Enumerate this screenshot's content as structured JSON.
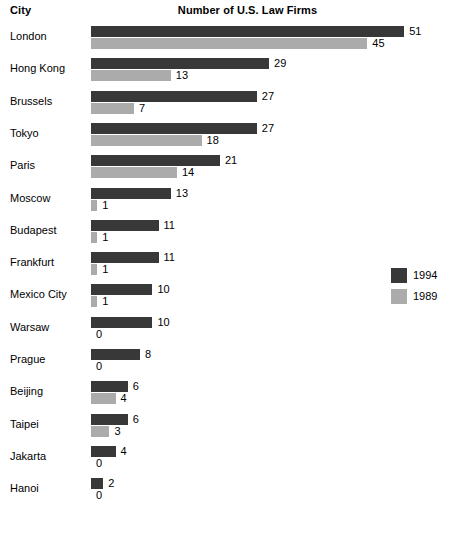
{
  "header": {
    "city_column_label": "City",
    "title": "Number of U.S. Law Firms"
  },
  "legend": {
    "position": "right",
    "items": [
      {
        "label": "1994",
        "color": "#383838",
        "swatch_name": "legend-swatch-1994"
      },
      {
        "label": "1989",
        "color": "#ababab",
        "swatch_name": "legend-swatch-1989"
      }
    ]
  },
  "chart_data": {
    "type": "bar",
    "orientation": "horizontal",
    "title": "Number of U.S. Law Firms",
    "xlabel": "",
    "ylabel": "City",
    "grid": false,
    "legend_position": "right",
    "xlim": [
      0,
      51
    ],
    "categories": [
      "London",
      "Hong Kong",
      "Brussels",
      "Tokyo",
      "Paris",
      "Moscow",
      "Budapest",
      "Frankfurt",
      "Mexico City",
      "Warsaw",
      "Prague",
      "Beijing",
      "Taipei",
      "Jakarta",
      "Hanoi"
    ],
    "series": [
      {
        "name": "1994",
        "color": "#383838",
        "values": [
          51,
          29,
          27,
          27,
          21,
          13,
          11,
          11,
          10,
          10,
          8,
          6,
          6,
          4,
          2
        ]
      },
      {
        "name": "1989",
        "color": "#ababab",
        "values": [
          45,
          13,
          7,
          18,
          14,
          1,
          1,
          1,
          1,
          0,
          0,
          4,
          3,
          0,
          0
        ]
      }
    ],
    "data_labels": {
      "1994": [
        "51",
        "29",
        "27",
        "27",
        "21",
        "13",
        "11",
        "11",
        "10",
        "10",
        "8",
        "6",
        "6",
        "4",
        "2"
      ],
      "1989": [
        "45",
        "13",
        "7",
        "18",
        "14",
        "1",
        "1",
        "1",
        "1",
        "0",
        "0",
        "4",
        "3",
        "0",
        "0"
      ]
    }
  },
  "scale": {
    "px_per_unit": 6.14,
    "bar_origin_x": 91
  }
}
